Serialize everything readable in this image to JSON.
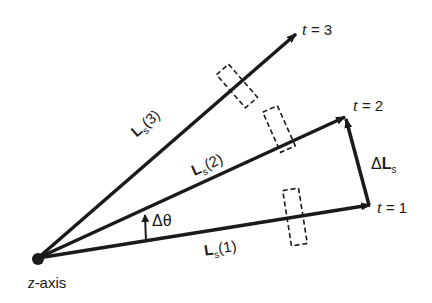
{
  "diagram": {
    "origin_label": {
      "var": "z",
      "rest": "-axis"
    },
    "vectors": [
      {
        "id": "Ls1",
        "name": "L",
        "sub": "s",
        "arg": "(1)",
        "time_label": {
          "var": "t",
          "eq": " = 1"
        }
      },
      {
        "id": "Ls2",
        "name": "L",
        "sub": "s",
        "arg": "(2)",
        "time_label": {
          "var": "t",
          "eq": " = 2"
        }
      },
      {
        "id": "Ls3",
        "name": "L",
        "sub": "s",
        "arg": "(3)",
        "time_label": {
          "var": "t",
          "eq": " = 3"
        }
      }
    ],
    "delta_L": {
      "delta": "Δ",
      "name": "L",
      "sub": "s"
    },
    "delta_theta": {
      "text": "Δθ"
    },
    "colors": {
      "ink": "#1a1a1a",
      "background": "#ffffff"
    }
  }
}
